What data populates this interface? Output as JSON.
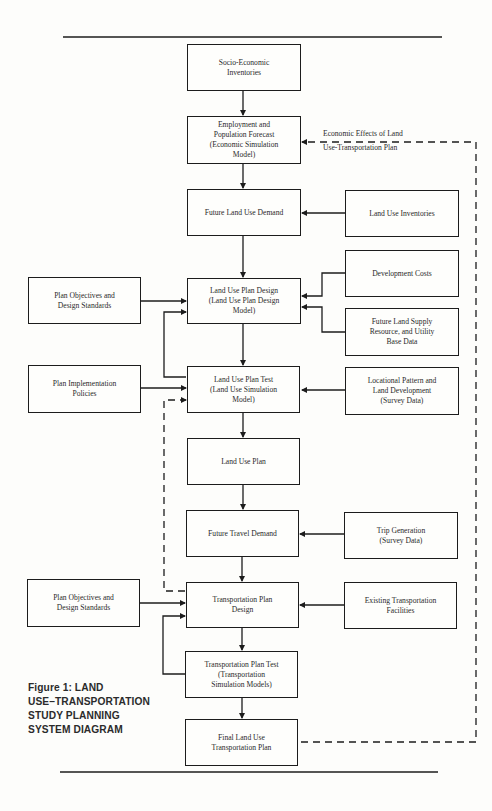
{
  "diagram": {
    "caption": "Figure 1:  LAND\nUSE–TRANSPORTATION\nSTUDY PLANNING\nSYSTEM DIAGRAM",
    "feedback_label_line1": "Economic Effects of Land",
    "feedback_label_line2": "Use-Transportation Plan",
    "colors": {
      "ink": "#1c1c1c",
      "paper": "#fdfdfb"
    },
    "center_column": [
      {
        "id": "socio_economic",
        "text": "Socio-Economic\nInventories"
      },
      {
        "id": "employment",
        "text": "Employment and\nPopulation Forecast\n(Economic Simulation\nModel)"
      },
      {
        "id": "future_land_use_demand",
        "text": "Future Land Use Demand"
      },
      {
        "id": "land_use_plan_design",
        "text": "Land Use Plan Design\n(Land Use Plan Design\nModel)"
      },
      {
        "id": "land_use_plan_test",
        "text": "Land Use Plan Test\n(Land Use Simulation\nModel)"
      },
      {
        "id": "land_use_plan",
        "text": "Land Use Plan"
      },
      {
        "id": "future_travel_demand",
        "text": "Future Travel Demand"
      },
      {
        "id": "transportation_plan_design",
        "text": "Transportation Plan\nDesign"
      },
      {
        "id": "transportation_plan_test",
        "text": "Transportation Plan Test\n(Transportation\nSimulation Models)"
      },
      {
        "id": "final_plan",
        "text": "Final Land Use\nTransportation Plan"
      }
    ],
    "right_column": [
      {
        "id": "land_use_inventories",
        "text": "Land Use Inventories"
      },
      {
        "id": "development_costs",
        "text": "Development Costs"
      },
      {
        "id": "future_land_supply",
        "text": "Future Land Supply\nResource, and Utility\nBase Data"
      },
      {
        "id": "locational_pattern",
        "text": "Locational Pattern and\nLand Development\n(Survey Data)"
      },
      {
        "id": "trip_generation",
        "text": "Trip Generation\n(Survey Data)"
      },
      {
        "id": "existing_transportation",
        "text": "Existing Transportation\nFacilities"
      }
    ],
    "left_column": [
      {
        "id": "plan_objectives_1",
        "text": "Plan Objectives and\nDesign Standards"
      },
      {
        "id": "plan_implementation",
        "text": "Plan Implementation\nPolicies"
      },
      {
        "id": "plan_objectives_2",
        "text": "Plan Objectives and\nDesign Standards"
      }
    ]
  }
}
